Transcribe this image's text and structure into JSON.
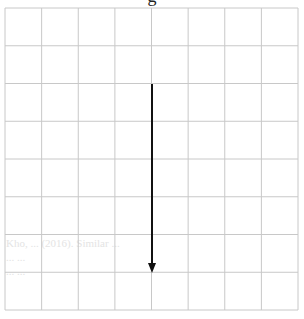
{
  "diagram": {
    "title_fragment": "g",
    "grid": {
      "columns": 8,
      "rows": 8,
      "left": 5,
      "top": 8,
      "right": 298,
      "bottom": 310,
      "line_color": "#c8c8c8"
    },
    "arrow": {
      "direction": "down",
      "x": 152,
      "y_start": 84,
      "y_end": 273,
      "color": "#111111"
    },
    "background_ghost_text": "Kho, ... (2016). Similar ...\n... ...\n... ..."
  }
}
